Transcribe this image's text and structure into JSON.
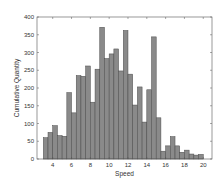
{
  "chart_data": {
    "type": "bar",
    "title": "",
    "xlabel": "Speed",
    "ylabel": "Cumulative Quantity",
    "xlim": [
      2.33,
      20.93
    ],
    "ylim": [
      0,
      400
    ],
    "bin_width": 0.5,
    "bin_start": 3.0,
    "x": [
      3.0,
      3.5,
      4.0,
      4.5,
      5.0,
      5.5,
      6.0,
      6.5,
      7.0,
      7.5,
      8.0,
      8.5,
      9.0,
      9.5,
      10.0,
      10.5,
      11.0,
      11.5,
      12.0,
      12.5,
      13.0,
      13.5,
      14.0,
      14.5,
      15.0,
      15.5,
      16.0,
      16.5,
      17.0,
      17.5,
      18.0,
      18.5,
      19.0,
      19.5
    ],
    "values": [
      60,
      75,
      94,
      66,
      64,
      187,
      130,
      235,
      233,
      262,
      160,
      253,
      371,
      283,
      296,
      310,
      248,
      362,
      239,
      152,
      203,
      104,
      195,
      344,
      116,
      22,
      37,
      63,
      37,
      19,
      25,
      14,
      11,
      13
    ],
    "xticks": [
      4,
      6,
      8,
      10,
      12,
      14,
      16,
      18,
      20
    ],
    "yticks": [
      0,
      50,
      100,
      150,
      200,
      250,
      300,
      350,
      400
    ],
    "grid": false,
    "legend": null,
    "bar_color": "#8a8a8a",
    "edge_color": "#4a4a4a"
  }
}
